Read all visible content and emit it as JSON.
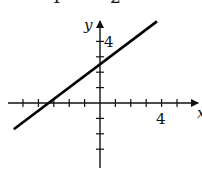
{
  "header": {
    "cut_text_left": "4",
    "cut_text_right": "2"
  },
  "chart_data": {
    "type": "line",
    "title": "",
    "xlabel": "x",
    "ylabel": "y",
    "equation": "y = (3/4)x + 5/2",
    "x_tick_label": "4",
    "y_tick_label": "4",
    "xlim": [
      -6,
      6
    ],
    "ylim": [
      -4,
      5
    ],
    "x_ticks": [
      -5,
      -4,
      -3,
      -2,
      -1,
      1,
      2,
      3,
      4,
      5
    ],
    "y_ticks": [
      -3,
      -2,
      -1,
      1,
      2,
      3,
      4
    ],
    "grid": false,
    "series": [
      {
        "name": "line",
        "x": [
          -5.6,
          3.7
        ],
        "y": [
          -1.7,
          5.3
        ],
        "slope": 0.75,
        "y_intercept": 2.5,
        "x_intercept": -3.33
      }
    ],
    "colors": {
      "line": "#000000",
      "axes": "#111111"
    }
  }
}
